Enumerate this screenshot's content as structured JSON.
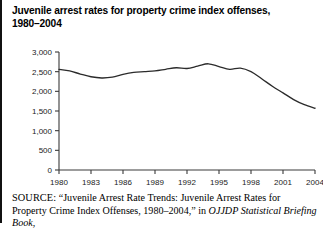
{
  "figure": {
    "title": "Juvenile arrest rates for property crime index offenses, 1980–2004",
    "title_line1": "Juvenile arrest rates for property crime index offenses,",
    "title_line2": "1980–2004",
    "source_label": "SOURCE:",
    "source_text_1": " “Juvenile Arrest Rate Trends: Juvenile Arrest Rates for Property Crime Index Offenses, 1980–2004,” in ",
    "source_italic": "OJJDP Statistical Briefing Book",
    "source_text_2": ","
  },
  "chart_data": {
    "type": "line",
    "title": "Juvenile arrest rates for property crime index offenses, 1980–2004",
    "xlabel": "",
    "ylabel": "",
    "xlim": [
      1980,
      2004
    ],
    "ylim": [
      0,
      3000
    ],
    "grid": false,
    "legend": "none",
    "line_color": "#2b2b2b",
    "axis_color": "#3a3a3a",
    "y_ticks": [
      0,
      500,
      1000,
      1500,
      2000,
      2500,
      3000
    ],
    "y_tick_labels": [
      "0",
      "500",
      "1,000",
      "1,500",
      "2,000",
      "2,500",
      "3,000"
    ],
    "x_ticks": [
      1980,
      1983,
      1986,
      1989,
      1992,
      1995,
      1998,
      2001,
      2004
    ],
    "x_tick_labels": [
      "1980",
      "1983",
      "1986",
      "1989",
      "1992",
      "1995",
      "1998",
      "2001",
      "2004"
    ],
    "x": [
      1980,
      1981,
      1982,
      1983,
      1984,
      1985,
      1986,
      1987,
      1988,
      1989,
      1990,
      1991,
      1992,
      1993,
      1994,
      1995,
      1996,
      1997,
      1998,
      1999,
      2000,
      2001,
      2002,
      2003,
      2004
    ],
    "series": [
      {
        "name": "Property crime index arrest rate",
        "values": [
          2560,
          2520,
          2440,
          2370,
          2340,
          2360,
          2430,
          2480,
          2500,
          2520,
          2560,
          2600,
          2580,
          2640,
          2700,
          2630,
          2560,
          2590,
          2500,
          2320,
          2130,
          1960,
          1790,
          1660,
          1570
        ]
      }
    ]
  }
}
